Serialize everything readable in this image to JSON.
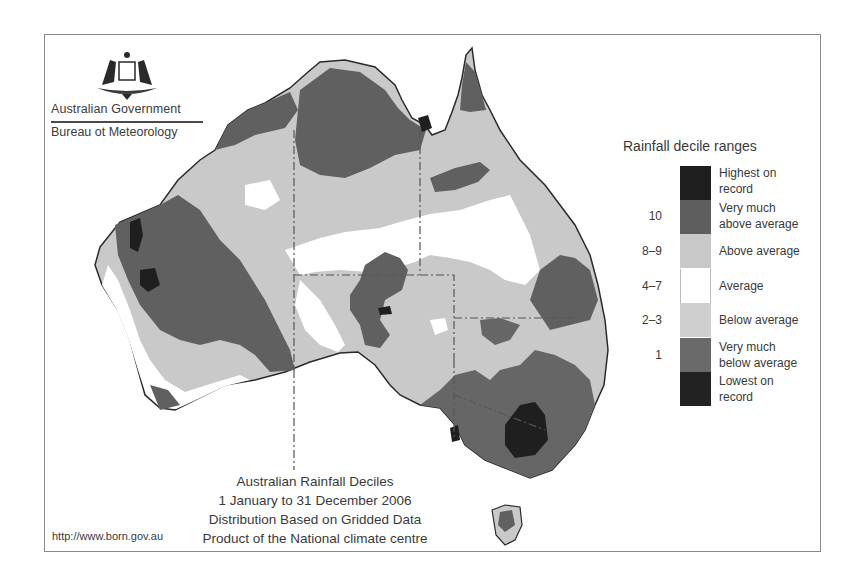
{
  "header": {
    "government": "Australian Government",
    "agency": "Bureau ot Meteorology",
    "crest_icon": "coat-of-arms-icon"
  },
  "legend": {
    "title": "Rainfall decile ranges",
    "items": [
      {
        "range": "",
        "label_line1": "Highest on",
        "label_line2": "record",
        "color": "#1e1e1e"
      },
      {
        "range": "10",
        "label_line1": "Very much",
        "label_line2": "above average",
        "color": "#5e5e5e"
      },
      {
        "range": "8–9",
        "label_line1": "Above average",
        "label_line2": "",
        "color": "#c8c8c8"
      },
      {
        "range": "4–7",
        "label_line1": "Average",
        "label_line2": "",
        "color": "#ffffff"
      },
      {
        "range": "2–3",
        "label_line1": "Below average",
        "label_line2": "",
        "color": "#cfcfcf"
      },
      {
        "range": "1",
        "label_line1": "Very much",
        "label_line2": "below average",
        "color": "#6a6a6a"
      },
      {
        "range": "",
        "label_line1": "Lowest on",
        "label_line2": "record",
        "color": "#222222"
      }
    ]
  },
  "caption": {
    "line1": "Australian Rainfall Deciles",
    "line2": "1 January to 31 December 2006",
    "line3": "Distribution Based on Gridded Data",
    "line4": "Product of the National climate centre"
  },
  "footer": {
    "url": "http://www.born.gov.au"
  },
  "map": {
    "region": "Australia",
    "period": "2006",
    "colors": {
      "record_dark": "#1f1f1f",
      "very_much": "#606060",
      "light": "#c9c9c9",
      "average": "#ffffff",
      "outline": "#2a2a2a",
      "border_dash": "#555555",
      "frame": "#8a8a8a"
    }
  }
}
